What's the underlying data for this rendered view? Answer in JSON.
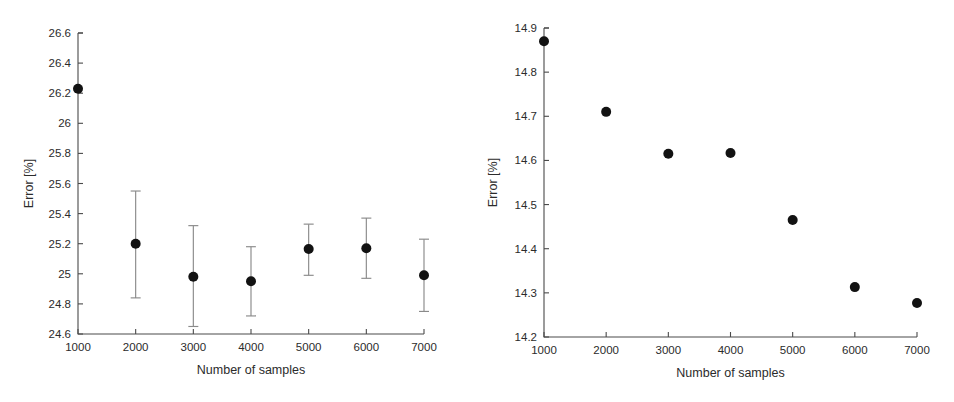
{
  "figure": {
    "panels": [
      {
        "name": "left-panel",
        "xlabel": "Number of samples",
        "ylabel": "Error [%]",
        "xticklabels": [
          "1000",
          "2000",
          "3000",
          "4000",
          "5000",
          "6000",
          "7000"
        ],
        "yticklabels": [
          "24.6",
          "24.8",
          "25",
          "25.2",
          "25.4",
          "25.6",
          "25.8",
          "26",
          "26.2",
          "26.4",
          "26.6"
        ]
      },
      {
        "name": "right-panel",
        "xlabel": "Number of samples",
        "ylabel": "Error [%]",
        "xticklabels": [
          "1000",
          "2000",
          "3000",
          "4000",
          "5000",
          "6000",
          "7000"
        ],
        "yticklabels": [
          "14.2",
          "14.3",
          "14.4",
          "14.5",
          "14.6",
          "14.7",
          "14.8",
          "14.9"
        ]
      }
    ]
  },
  "colors": {
    "marker": "#121212",
    "errorbar": "#8a8a8a",
    "axis": "#4a4a4a",
    "text": "#2b2b2b",
    "background": "#ffffff"
  },
  "chart_data": [
    {
      "type": "scatter",
      "name": "left-panel",
      "title": "",
      "xlabel": "Number of samples",
      "ylabel": "Error [%]",
      "xlim": [
        1000,
        7000
      ],
      "ylim": [
        24.6,
        26.6
      ],
      "ytick_step": 0.2,
      "xtick_step": 1000,
      "grid": false,
      "legend": null,
      "has_errorbars": true,
      "x": [
        1000,
        2000,
        3000,
        4000,
        5000,
        6000,
        7000
      ],
      "values": [
        26.23,
        25.2,
        24.98,
        24.95,
        25.165,
        25.17,
        24.99
      ],
      "error_low": [
        26.23,
        24.84,
        24.65,
        24.72,
        24.99,
        24.97,
        24.75
      ],
      "error_high": [
        26.23,
        25.55,
        25.32,
        25.18,
        25.33,
        25.37,
        25.23
      ]
    },
    {
      "type": "scatter",
      "name": "right-panel",
      "title": "",
      "xlabel": "Number of samples",
      "ylabel": "Error [%]",
      "xlim": [
        1000,
        7000
      ],
      "ylim": [
        14.2,
        14.9
      ],
      "ytick_step": 0.1,
      "xtick_step": 1000,
      "grid": false,
      "legend": null,
      "has_errorbars": false,
      "x": [
        1000,
        2000,
        3000,
        4000,
        5000,
        6000,
        7000
      ],
      "values": [
        14.87,
        14.71,
        14.615,
        14.617,
        14.465,
        14.313,
        14.277
      ]
    }
  ]
}
